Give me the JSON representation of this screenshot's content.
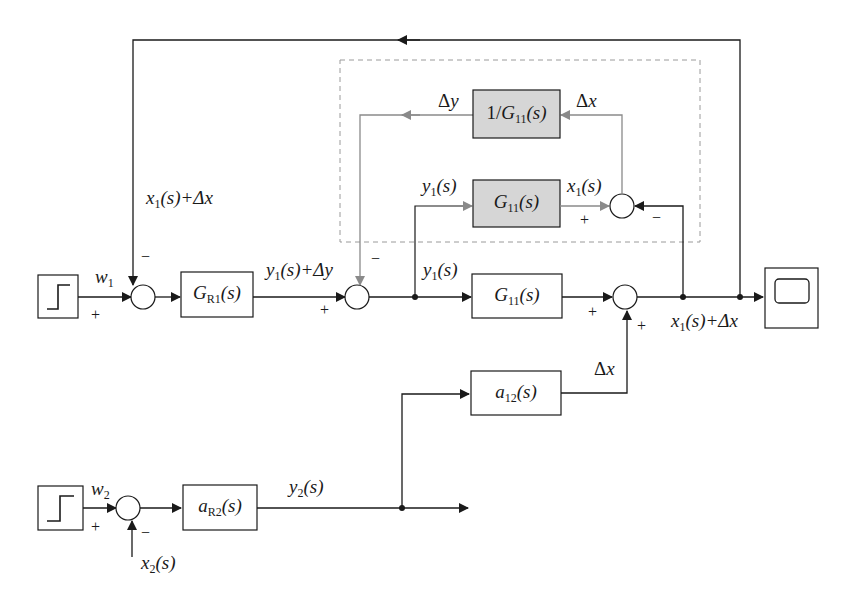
{
  "diagram": {
    "type": "block-diagram",
    "colors": {
      "line": "#1a1a1a",
      "inner_loop": "#8a8a8a",
      "gray_block_fill": "#d6d6d6",
      "dashed_box": "#9a9a9a"
    },
    "blocks": {
      "step1": {
        "name": "step-input-1"
      },
      "step2": {
        "name": "step-input-2"
      },
      "GR1": {
        "sym": "G",
        "sub": "R1",
        "arg": "(s)"
      },
      "G11_main": {
        "sym": "G",
        "sub": "11",
        "arg": "(s)"
      },
      "G11_model": {
        "sym": "G",
        "sub": "11",
        "arg": "(s)"
      },
      "G11_inverse": {
        "prefix": "1/",
        "sym": "G",
        "sub": "11",
        "arg": "(s)"
      },
      "a12": {
        "sym": "a",
        "sub": "12",
        "arg": "(s)"
      },
      "aR2": {
        "sym": "a",
        "sub": "R2",
        "arg": "(s)"
      },
      "scope": {
        "name": "scope"
      }
    },
    "signals": {
      "w1": {
        "sym": "w",
        "sub": "1"
      },
      "w2": {
        "sym": "w",
        "sub": "2"
      },
      "fb_top": {
        "sym": "x",
        "sub": "1",
        "rest": "(s)+Δ",
        "var": "x"
      },
      "y1_plus_dy": {
        "sym": "y",
        "sub": "1",
        "rest": "(s)+Δ",
        "var": "y"
      },
      "y1_main": {
        "sym": "y",
        "sub": "1",
        "rest": "(s)"
      },
      "y1_model": {
        "sym": "y",
        "sub": "1",
        "rest": "(s)"
      },
      "x1_model": {
        "sym": "x",
        "sub": "1",
        "rest": "(s)"
      },
      "dy": {
        "delta": "Δ",
        "var": "y"
      },
      "dx_inner": {
        "delta": "Δ",
        "var": "x"
      },
      "output": {
        "sym": "x",
        "sub": "1",
        "rest": "(s)+Δ",
        "var": "x"
      },
      "dx_coupling": {
        "delta": "Δ",
        "var": "x"
      },
      "y2": {
        "sym": "y",
        "sub": "2",
        "rest": "(s)"
      },
      "x2": {
        "sym": "x",
        "sub": "2",
        "rest": "(s)"
      }
    },
    "signs": {
      "sum1_left": "+",
      "sum1_top": "−",
      "sum2_left": "+",
      "sum2_top": "−",
      "sum3_left": "+",
      "sum3_bottom": "+",
      "inner_left": "+",
      "inner_right": "−",
      "sum4_left": "+",
      "sum4_bottom": "−"
    }
  }
}
